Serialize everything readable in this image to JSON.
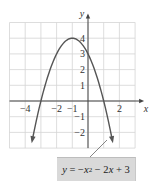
{
  "chart_data": {
    "type": "line",
    "title": "",
    "equation": "y = -x^2 - 2x + 3",
    "xlabel": "x",
    "ylabel": "y",
    "xlim": [
      -5,
      3
    ],
    "ylim": [
      -3,
      5
    ],
    "grid": true,
    "x_ticks": [
      -4,
      -2,
      -1,
      2
    ],
    "x_tick_labels": [
      "−4",
      "−2",
      "−1",
      "2"
    ],
    "y_ticks": [
      4,
      3,
      2,
      1,
      -1,
      -2
    ],
    "y_tick_labels": [
      "4",
      "3",
      "2",
      "1",
      "−1",
      "−2"
    ],
    "series": [
      {
        "name": "y = -x^2 - 2x + 3",
        "x": [
          -3.6,
          -3,
          -2.5,
          -2,
          -1.5,
          -1,
          -0.5,
          0,
          0.5,
          1,
          1.6
        ],
        "y": [
          -2.76,
          0,
          1.75,
          3,
          3.75,
          4,
          3.75,
          3,
          1.75,
          0,
          -2.76
        ],
        "vertex": [
          -1,
          4
        ],
        "x_intercepts": [
          -3,
          1
        ],
        "y_intercept": 3,
        "arrows_at_ends": true
      }
    ],
    "annotations": [
      {
        "text": "y = −x² − 2x + 3",
        "position": "bottom-right",
        "pointer_to_curve": true
      }
    ],
    "colors": {
      "curve": "#555555",
      "grid": "#cfcfcf",
      "axis": "#444444",
      "label_bg": "#d9d9d9"
    }
  },
  "label": {
    "y": "y",
    "eq": "=",
    "minus1": "−",
    "x1": "x",
    "exp": "2",
    "minus2": "− 2",
    "x2": "x",
    "plus": "+ 3"
  }
}
